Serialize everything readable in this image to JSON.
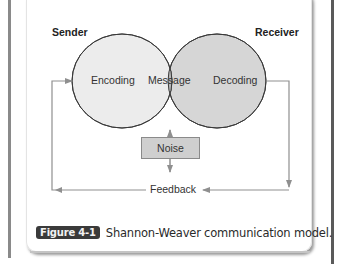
{
  "diagram": {
    "title": "Shannon-Weaver communication model",
    "sender_label": "Sender",
    "receiver_label": "Receiver",
    "nodes": {
      "encoding": "Encoding",
      "message": "Message",
      "decoding": "Decoding",
      "noise": "Noise",
      "feedback": "Feedback"
    },
    "edges": [
      {
        "from": "noise",
        "to": "message"
      },
      {
        "from": "noise",
        "to": "feedback"
      },
      {
        "from": "decoding",
        "to": "feedback"
      },
      {
        "from": "feedback",
        "to": "encoding"
      }
    ],
    "colors": {
      "encoding_fill": "#ececec",
      "decoding_fill": "#d6d6d6",
      "message_fill": "#b8b8b8",
      "noise_fill": "#cfcfcf",
      "arrow": "#8f8f8f",
      "badge": "#3a3a3a"
    }
  },
  "caption": {
    "badge": "Figure 4-1",
    "text": "Shannon-Weaver communication model."
  }
}
